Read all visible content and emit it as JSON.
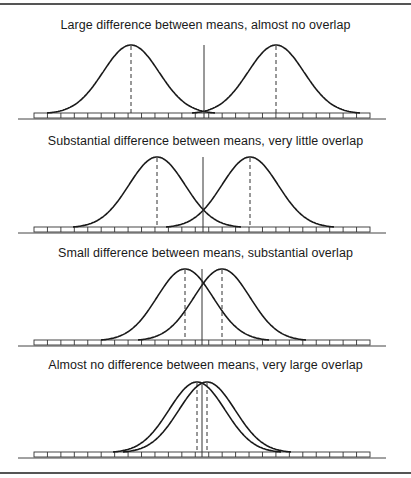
{
  "figure": {
    "panels": [
      {
        "title": "Large difference between means, almost no overlap"
      },
      {
        "title": "Substantial difference between means, very little overlap"
      },
      {
        "title": "Small difference between means, substantial overlap"
      },
      {
        "title": "Almost no difference between means, very large overlap"
      }
    ]
  },
  "chart_data": {
    "type": "diagram",
    "title": "",
    "axis": {
      "segments": 25,
      "ticks_labeled": false
    },
    "panels": [
      {
        "title": "Large difference between means, almost no overlap",
        "curve_a_mean_px": 131,
        "curve_b_mean_px": 276,
        "midpoint_px": 204,
        "overlap": "almost none"
      },
      {
        "title": "Substantial difference between means, very little overlap",
        "curve_a_mean_px": 157,
        "curve_b_mean_px": 250,
        "midpoint_px": 203,
        "overlap": "very little"
      },
      {
        "title": "Small difference between means, substantial overlap",
        "curve_a_mean_px": 185,
        "curve_b_mean_px": 222,
        "midpoint_px": 202,
        "overlap": "substantial"
      },
      {
        "title": "Almost no difference between means, very large overlap",
        "curve_a_mean_px": 197,
        "curve_b_mean_px": 207,
        "midpoint_px": 202,
        "overlap": "very large"
      }
    ]
  }
}
